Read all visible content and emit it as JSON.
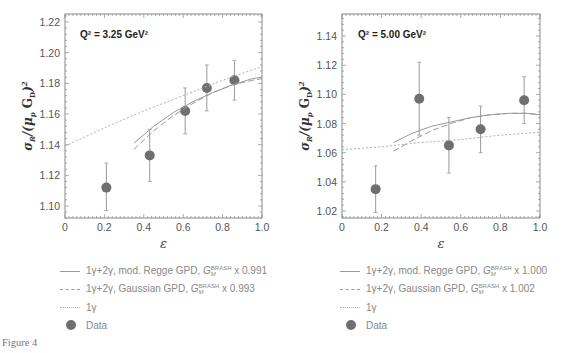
{
  "figure": {
    "caption": "Figure 4"
  },
  "chart_data": [
    {
      "type": "scatter",
      "panel": "left",
      "annotation": "Q² = 3.25 GeV²",
      "xlabel": "ε",
      "ylabel": "σR/(μp GD)²",
      "xlim": [
        0,
        1.0
      ],
      "ylim": [
        1.092,
        1.225
      ],
      "xticks": [
        "0",
        "0.2",
        "0.4",
        "0.6",
        "0.8",
        "1.0"
      ],
      "yticks": [
        "1.10",
        "1.12",
        "1.14",
        "1.16",
        "1.18",
        "1.20",
        "1.22"
      ],
      "grid": false,
      "series": [
        {
          "name": "Data",
          "style": "points",
          "points": [
            {
              "x": 0.21,
              "y": 1.112,
              "ylo": 1.097,
              "yhi": 1.128
            },
            {
              "x": 0.43,
              "y": 1.133,
              "ylo": 1.116,
              "yhi": 1.15
            },
            {
              "x": 0.61,
              "y": 1.162,
              "ylo": 1.147,
              "yhi": 1.177
            },
            {
              "x": 0.72,
              "y": 1.177,
              "ylo": 1.162,
              "yhi": 1.192
            },
            {
              "x": 0.86,
              "y": 1.182,
              "ylo": 1.169,
              "yhi": 1.195
            }
          ]
        },
        {
          "name": "1γ+2γ, mod. Regge GPD, G_M^BRASH x 0.991",
          "style": "solid",
          "x": [
            0.35,
            0.45,
            0.55,
            0.65,
            0.75,
            0.85,
            0.95,
            1.0
          ],
          "y": [
            1.141,
            1.152,
            1.161,
            1.168,
            1.174,
            1.179,
            1.183,
            1.184
          ]
        },
        {
          "name": "1γ+2γ, Gaussian GPD, G_M^BRASH x 0.993",
          "style": "dashed",
          "x": [
            0.35,
            0.45,
            0.55,
            0.65,
            0.75,
            0.85,
            0.95,
            1.0
          ],
          "y": [
            1.137,
            1.149,
            1.159,
            1.167,
            1.174,
            1.179,
            1.182,
            1.183
          ]
        },
        {
          "name": "1γ",
          "style": "dotted",
          "x": [
            0.0,
            0.2,
            0.4,
            0.6,
            0.8,
            1.0
          ],
          "y": [
            1.139,
            1.151,
            1.162,
            1.172,
            1.182,
            1.191
          ]
        }
      ]
    },
    {
      "type": "scatter",
      "panel": "right",
      "annotation": "Q² = 5.00 GeV²",
      "xlabel": "ε",
      "ylabel": "σR/(μp GD)²",
      "xlim": [
        0,
        1.0
      ],
      "ylim": [
        1.015,
        1.155
      ],
      "xticks": [
        "0",
        "0.2",
        "0.4",
        "0.6",
        "0.8",
        "1.0"
      ],
      "yticks": [
        "1.02",
        "1.04",
        "1.06",
        "1.08",
        "1.10",
        "1.12",
        "1.14"
      ],
      "grid": false,
      "series": [
        {
          "name": "Data",
          "style": "points",
          "points": [
            {
              "x": 0.17,
              "y": 1.035,
              "ylo": 1.019,
              "yhi": 1.051
            },
            {
              "x": 0.39,
              "y": 1.097,
              "ylo": 1.072,
              "yhi": 1.122
            },
            {
              "x": 0.54,
              "y": 1.065,
              "ylo": 1.046,
              "yhi": 1.084
            },
            {
              "x": 0.7,
              "y": 1.076,
              "ylo": 1.06,
              "yhi": 1.092
            },
            {
              "x": 0.92,
              "y": 1.096,
              "ylo": 1.08,
              "yhi": 1.112
            }
          ]
        },
        {
          "name": "1γ+2γ, mod. Regge GPD, G_M^BRASH x 1.000",
          "style": "solid",
          "x": [
            0.26,
            0.35,
            0.45,
            0.55,
            0.65,
            0.75,
            0.85,
            0.93,
            1.0
          ],
          "y": [
            1.067,
            1.073,
            1.078,
            1.081,
            1.084,
            1.086,
            1.087,
            1.087,
            1.086
          ]
        },
        {
          "name": "1γ+2γ, Gaussian GPD, G_M^BRASH x 1.002",
          "style": "dashed",
          "x": [
            0.26,
            0.35,
            0.45,
            0.55,
            0.65,
            0.75,
            0.85,
            0.93,
            1.0
          ],
          "y": [
            1.061,
            1.068,
            1.075,
            1.08,
            1.084,
            1.086,
            1.087,
            1.087,
            1.086
          ]
        },
        {
          "name": "1γ",
          "style": "dotted",
          "x": [
            0.0,
            0.2,
            0.4,
            0.6,
            0.8,
            1.0
          ],
          "y": [
            1.062,
            1.064,
            1.067,
            1.069,
            1.072,
            1.074
          ]
        }
      ]
    }
  ],
  "legends": {
    "left": [
      {
        "style": "solid",
        "pre": "1γ+2γ, mod. Regge GPD, ",
        "gm": "G",
        "sup": "BRASH",
        "sub": "M",
        "post": " x 0.991"
      },
      {
        "style": "dashed",
        "pre": "1γ+2γ, Gaussian GPD, ",
        "gm": "G",
        "sup": "BRASH",
        "sub": "M",
        "post": " x 0.993"
      },
      {
        "style": "dotted",
        "pre": "1γ",
        "gm": "",
        "sup": "",
        "sub": "",
        "post": ""
      },
      {
        "style": "dot",
        "pre": "Data",
        "gm": "",
        "sup": "",
        "sub": "",
        "post": ""
      }
    ],
    "right": [
      {
        "style": "solid",
        "pre": "1γ+2γ, mod. Regge GPD, ",
        "gm": "G",
        "sup": "BRASH",
        "sub": "M",
        "post": " x 1.000"
      },
      {
        "style": "dashed",
        "pre": "1γ+2γ, Gaussian GPD, ",
        "gm": "G",
        "sup": "BRASH",
        "sub": "M",
        "post": " x 1.002"
      },
      {
        "style": "dotted",
        "pre": "1γ",
        "gm": "",
        "sup": "",
        "sub": "",
        "post": ""
      },
      {
        "style": "dot",
        "pre": "Data",
        "gm": "",
        "sup": "",
        "sub": "",
        "post": ""
      }
    ]
  },
  "colors": {
    "frame": "#8a8a8a",
    "curve": "#9a9a9a",
    "dotted": "#b0b0b0",
    "marker": "#6f6f6f",
    "errbar": "#9a9a9a"
  }
}
